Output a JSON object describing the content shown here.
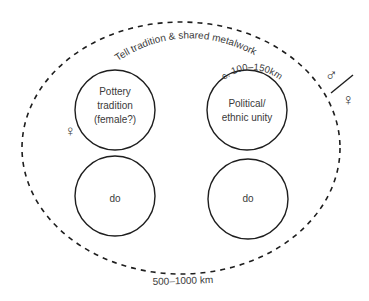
{
  "diagram": {
    "outer_region": {
      "label_top": "Tell tradition  & shared metalwork",
      "label_bottom": "500–1000 km"
    },
    "circles": [
      {
        "id": "top-left",
        "lines": [
          "Pottery",
          "tradition",
          "(female?)"
        ]
      },
      {
        "id": "top-right",
        "lines": [
          "Political/",
          "ethnic unity"
        ],
        "arc_label": "c. 100–150km"
      },
      {
        "id": "bottom-left",
        "lines": [
          "do"
        ]
      },
      {
        "id": "bottom-right",
        "lines": [
          "do"
        ]
      }
    ],
    "symbols": {
      "female_near_pottery": "♀",
      "male": "♂",
      "female": "♀",
      "separator": "/"
    }
  }
}
